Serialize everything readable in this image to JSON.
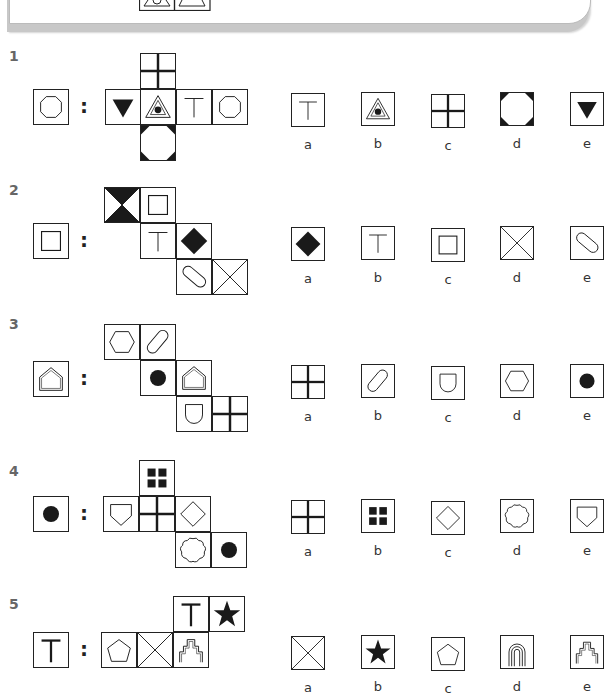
{
  "header_strip": {
    "partial_labels": [
      "a",
      "b",
      "c",
      "d",
      "e"
    ]
  },
  "problems": [
    {
      "number": "1",
      "target": "octagon",
      "net": [
        "cross-thick",
        "triangle-down-filled",
        "triangle-dot",
        "T",
        "octagon",
        "octagon-black-corners"
      ],
      "options": [
        {
          "label": "a",
          "shape": "T"
        },
        {
          "label": "b",
          "shape": "triangle-dot"
        },
        {
          "label": "c",
          "shape": "cross-thick"
        },
        {
          "label": "d",
          "shape": "octagon-black-corners"
        },
        {
          "label": "e",
          "shape": "triangle-down-filled"
        }
      ]
    },
    {
      "number": "2",
      "target": "square-inset",
      "net": [
        "hourglass-black",
        "square-inset",
        "T",
        "diamond-filled",
        "capsule",
        "x-cross"
      ],
      "options": [
        {
          "label": "a",
          "shape": "diamond-filled"
        },
        {
          "label": "b",
          "shape": "T"
        },
        {
          "label": "c",
          "shape": "square-inset"
        },
        {
          "label": "d",
          "shape": "x-cross"
        },
        {
          "label": "e",
          "shape": "capsule"
        }
      ]
    },
    {
      "number": "3",
      "target": "house-pentagon",
      "net": [
        "hexagon",
        "capsule-right",
        "circle-filled",
        "house-pentagon",
        "shield-u",
        "cross-thick"
      ],
      "options": [
        {
          "label": "a",
          "shape": "cross-thick"
        },
        {
          "label": "b",
          "shape": "capsule-right"
        },
        {
          "label": "c",
          "shape": "shield-u"
        },
        {
          "label": "d",
          "shape": "hexagon"
        },
        {
          "label": "e",
          "shape": "circle-filled"
        }
      ]
    },
    {
      "number": "4",
      "target": "circle-filled",
      "net": [
        "four-squares",
        "home-plate",
        "cross-thick",
        "diamond-outline",
        "wavy-circle",
        "circle-filled"
      ],
      "options": [
        {
          "label": "a",
          "shape": "cross-thick"
        },
        {
          "label": "b",
          "shape": "four-squares"
        },
        {
          "label": "c",
          "shape": "diamond-outline"
        },
        {
          "label": "d",
          "shape": "wavy-circle"
        },
        {
          "label": "e",
          "shape": "home-plate"
        }
      ]
    },
    {
      "number": "5",
      "target": "T-bold",
      "net": [
        "T-bold",
        "star-filled",
        "pentagon",
        "x-cross",
        "stepped-tower"
      ],
      "options": [
        {
          "label": "a",
          "shape": "x-cross"
        },
        {
          "label": "b",
          "shape": "star-filled"
        },
        {
          "label": "c",
          "shape": "pentagon"
        },
        {
          "label": "d",
          "shape": "arch-rings"
        },
        {
          "label": "e",
          "shape": "stepped-tower"
        }
      ]
    }
  ],
  "colon": ":",
  "colors": {
    "ink": "#222222",
    "number": "#666666",
    "shadow": "#c8c8c8"
  }
}
